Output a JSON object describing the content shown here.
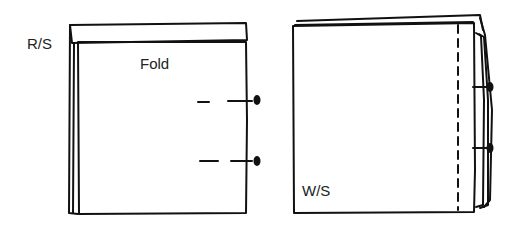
{
  "diagram": {
    "left_panel": {
      "side_label": "R/S",
      "fold_label": "Fold",
      "pins": 2
    },
    "right_panel": {
      "side_label": "W/S",
      "pins": 2,
      "stitch_line": "dashed"
    },
    "colors": {
      "ink": "#111111",
      "paper": "#ffffff"
    }
  }
}
